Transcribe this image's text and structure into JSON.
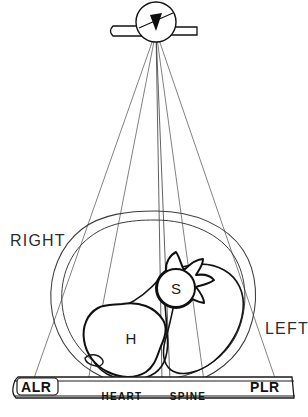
{
  "figure": {
    "background_color": "#ffffff",
    "ink_color": "#111111",
    "ray_color": "#4a4a4a"
  },
  "source": {
    "name": "x-ray-tube",
    "focal_spot": {
      "x": 156,
      "y": 31
    },
    "housing_radius": 21,
    "arm_left_x": 113,
    "arm_right_x": 198
  },
  "beam": {
    "ray_count": 6,
    "rays": [
      {
        "label": "ray-1-outer-right",
        "x_end": 33
      },
      {
        "label": "ray-2-heart-right",
        "x_end": 88
      },
      {
        "label": "ray-3-heart-left",
        "x_end": 162
      },
      {
        "label": "ray-4-spine-right",
        "x_end": 170
      },
      {
        "label": "ray-5-spine-left",
        "x_end": 204
      },
      {
        "label": "ray-6-outer-left",
        "x_end": 276
      }
    ],
    "detector_y": 380
  },
  "side_labels": {
    "right": "RIGHT",
    "left": "LEFT"
  },
  "organs": [
    {
      "name": "heart",
      "letter": "H",
      "cx": 131,
      "cy": 338
    },
    {
      "name": "spine",
      "letter": "S",
      "cx": 176,
      "cy": 288
    }
  ],
  "detector": {
    "left_label": "ALR",
    "right_label": "PLR",
    "bar": {
      "x": 14,
      "y": 375,
      "width": 280,
      "height": 20
    },
    "shadows": [
      {
        "name": "heart-shadow",
        "label": "HEART",
        "x": 85,
        "width": 75,
        "fill": "hatch"
      },
      {
        "name": "dense-band",
        "label": "",
        "x": 160,
        "width": 10,
        "fill": "solid"
      },
      {
        "name": "spine-shadow",
        "label": "SPINE",
        "x": 170,
        "width": 36,
        "fill": "hatch"
      }
    ]
  }
}
